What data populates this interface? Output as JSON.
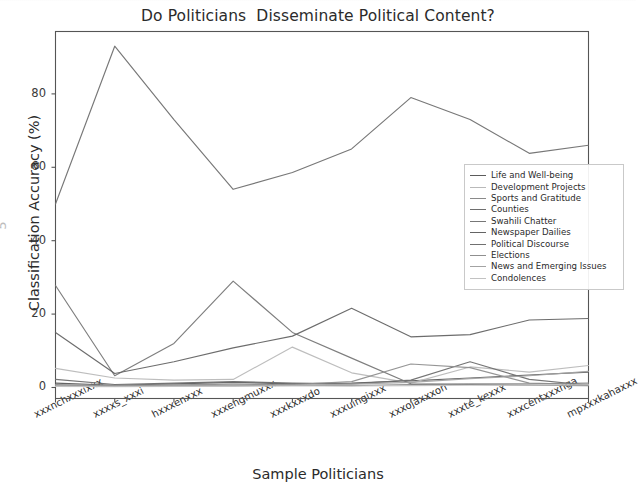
{
  "chart_data": {
    "type": "line",
    "title": "Do Politicians  Disseminate Political Content?",
    "xlabel": "Sample Politicians",
    "ylabel": "Classification Accuracy (%)",
    "ylim": [
      -3,
      97
    ],
    "yticks": [
      0,
      20,
      40,
      60,
      80
    ],
    "ytick_labels": [
      "0",
      "20",
      "40",
      "60",
      "80"
    ],
    "grid": false,
    "legend_position": "center right",
    "categories": [
      "xxxnchxxxixxx",
      "xxxxs_xxxi",
      "hxxxenxxx",
      "xxxengmuxxx",
      "xxxkxxxdo",
      "xxxuingixxx",
      "xxxojaxxxon",
      "xxxte_kexxx",
      "xxxcentxxxnga",
      "mpxxxkahaxxx"
    ],
    "series": [
      {
        "name": "Life and Well-being",
        "color": "#5b5b5b",
        "values": [
          1.2,
          0.6,
          1.0,
          1.4,
          1.0,
          1.2,
          1.8,
          2.6,
          3.4,
          4.2
        ]
      },
      {
        "name": "Development  Projects",
        "color": "#b9b9b9",
        "values": [
          5.2,
          2.6,
          2.0,
          2.2,
          11.0,
          4.0,
          1.2,
          5.6,
          4.2,
          6.0
        ]
      },
      {
        "name": "Sports and  Gratitude",
        "color": "#8a8a8a",
        "values": [
          0.6,
          0.4,
          0.5,
          0.6,
          0.6,
          0.5,
          0.8,
          1.0,
          1.0,
          1.2
        ]
      },
      {
        "name": "Counties",
        "color": "#6e6e6e",
        "values": [
          2.2,
          0.8,
          1.2,
          1.6,
          1.2,
          1.0,
          2.0,
          7.0,
          2.2,
          0.6
        ]
      },
      {
        "name": "Swahili Chatter",
        "color": "#777777",
        "values": [
          27.8,
          3.2,
          12.0,
          29.0,
          15.0,
          8.0,
          1.0,
          0.8,
          0.6,
          0.5
        ]
      },
      {
        "name": "Newspaper Dailies",
        "color": "#646464",
        "values": [
          15.0,
          3.8,
          7.0,
          10.8,
          14.0,
          21.6,
          13.8,
          14.4,
          18.4,
          18.8
        ]
      },
      {
        "name": "Political Discourse",
        "color": "#707070",
        "values": [
          50.0,
          93.0,
          73.0,
          54.0,
          58.6,
          65.0,
          79.0,
          73.0,
          63.8,
          66.0
        ]
      },
      {
        "name": "Elections",
        "color": "#8f8f8f",
        "values": [
          0.8,
          0.5,
          0.7,
          0.9,
          0.8,
          1.6,
          6.4,
          5.4,
          1.2,
          0.8
        ]
      },
      {
        "name": "News and Emerging  Issues",
        "color": "#a3a3a3",
        "values": [
          0.4,
          0.3,
          0.4,
          0.5,
          0.6,
          0.9,
          1.4,
          2.4,
          3.2,
          4.4
        ]
      },
      {
        "name": "Condolences",
        "color": "#c2c2c2",
        "values": [
          0.3,
          0.2,
          0.3,
          0.3,
          0.4,
          0.4,
          0.5,
          0.6,
          0.6,
          0.7
        ]
      }
    ]
  },
  "ghost_glyph": "5"
}
